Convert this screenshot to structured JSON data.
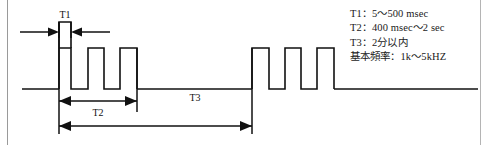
{
  "diagram": {
    "title_visible": false,
    "labels": {
      "t1": "T1",
      "t2": "T2",
      "t3": "T3"
    },
    "specs": [
      "T1：5～500 msec",
      "T2：400 msec～2 sec",
      "T3：2分以内",
      "基本頻率：1k～5kHZ"
    ],
    "colors": {
      "line": "#111111",
      "frame": "#9a9a9a",
      "background": "#ffffff",
      "text": "#1a1a1a"
    },
    "waveform": {
      "type": "pulse-train-timing",
      "burst_1_pulses": 4,
      "burst_2_pulses": 3,
      "first_pulse_is_tall": true
    }
  }
}
